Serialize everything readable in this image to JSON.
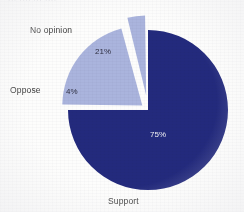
{
  "title_fragment": "··· ···· ··· ····",
  "colors": {
    "support": "#232a7d",
    "other": "#aab4dd",
    "background": "#fdfdfc",
    "label_text": "#3a3a3a",
    "pct_on_dark": "#f2f2f5",
    "pct_on_light": "#2e2e40"
  },
  "labels": {
    "no_opinion": "No opinion",
    "oppose": "Oppose",
    "support": "Support"
  },
  "values": {
    "no_opinion_pct": "21%",
    "oppose_pct": "4%",
    "support_pct": "75%"
  },
  "chart_data": {
    "type": "pie",
    "title": "",
    "xlabel": "",
    "ylabel": "",
    "categories": [
      "Support",
      "No opinion",
      "Oppose"
    ],
    "values": [
      75,
      21,
      4
    ],
    "data_labels": [
      "75%",
      "21%",
      "4%"
    ],
    "slice_colors": [
      "#232a7d",
      "#aab4dd",
      "#aab4dd"
    ],
    "exploded": [
      false,
      true,
      true
    ],
    "legend": "none",
    "grid": false,
    "units": "percent",
    "total": 100,
    "start_angle_deg": 0,
    "direction": "clockwise"
  }
}
